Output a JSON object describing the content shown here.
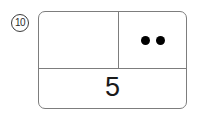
{
  "item": {
    "number_label": "10",
    "number_marker_style": "circled"
  },
  "diagram": {
    "type": "part-part-whole-box",
    "top_row": {
      "left_cell": {
        "label": "",
        "dot_count": 0,
        "state": "empty"
      },
      "right_cell": {
        "label": "",
        "dot_count": 2,
        "dots": [
          "dot",
          "dot"
        ],
        "dot_color": "#000000"
      }
    },
    "bottom_row": {
      "value": "5"
    },
    "border_color": "#7d7d7d",
    "background_color": "#ffffff"
  }
}
